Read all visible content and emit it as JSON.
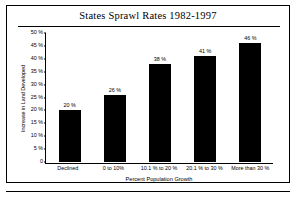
{
  "figure": {
    "title": "States Sprawl Rates 1982-1997"
  },
  "chart_data": {
    "type": "bar",
    "title": "States Sprawl Rates 1982-1997",
    "xlabel": "Percent Population Growth",
    "ylabel": "Increase in Land Developed",
    "categories": [
      "Declined",
      "0 to 10%",
      "10.1 % to 20 %",
      "20.1 % to 30 %",
      "More than 30 %"
    ],
    "values": [
      20,
      26,
      38,
      41,
      46
    ],
    "value_labels": [
      "20 %",
      "26 %",
      "38 %",
      "41 %",
      "46 %"
    ],
    "ylim": [
      0,
      50
    ],
    "ytick_values": [
      0,
      5,
      10,
      15,
      20,
      25,
      30,
      35,
      40,
      45,
      50
    ],
    "ytick_labels": [
      "0",
      "5 %",
      "10 %",
      "15 %",
      "20 %",
      "25 %",
      "30 %",
      "35 %",
      "40 %",
      "45 %",
      "50 %"
    ],
    "grid": false,
    "legend": null,
    "bar_color": "#000000",
    "axis_color": "#000000",
    "background": "#ffffff"
  }
}
